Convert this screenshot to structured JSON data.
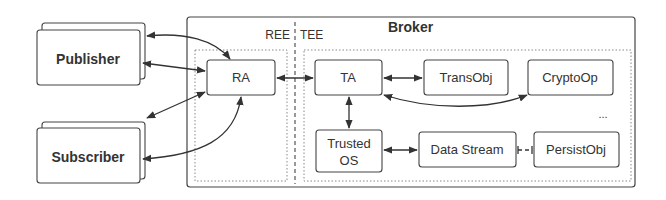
{
  "diagram": {
    "title": "Broker",
    "regions": {
      "ree_label": "REE",
      "tee_label": "TEE"
    },
    "external": {
      "publisher": "Publisher",
      "subscriber": "Subscriber"
    },
    "components": {
      "ra": "RA",
      "ta": "TA",
      "transobj": "TransObj",
      "cryptoop": "CryptoOp",
      "trusted_os_line1": "Trusted",
      "trusted_os_line2": "OS",
      "data_stream": "Data Stream",
      "persistobj": "PersistObj",
      "ellipsis": "..."
    },
    "edges": [
      {
        "from": "Publisher",
        "to": "RA",
        "type": "bidirectional-curved"
      },
      {
        "from": "Publisher",
        "to": "RA",
        "type": "bidirectional"
      },
      {
        "from": "Subscriber",
        "to": "RA",
        "type": "bidirectional"
      },
      {
        "from": "Subscriber",
        "to": "RA",
        "type": "bidirectional-curved"
      },
      {
        "from": "RA",
        "to": "TA",
        "type": "bidirectional"
      },
      {
        "from": "TA",
        "to": "TransObj",
        "type": "bidirectional"
      },
      {
        "from": "TA",
        "to": "CryptoOp",
        "type": "bidirectional-curved"
      },
      {
        "from": "TA",
        "to": "Trusted OS",
        "type": "bidirectional"
      },
      {
        "from": "Trusted OS",
        "to": "Data Stream",
        "type": "bidirectional"
      },
      {
        "from": "Data Stream",
        "to": "PersistObj",
        "type": "dashed-line"
      }
    ],
    "colors": {
      "stroke": "#3a3a3a",
      "dotted": "#8a8a8a",
      "text": "#2a2a2a"
    }
  }
}
